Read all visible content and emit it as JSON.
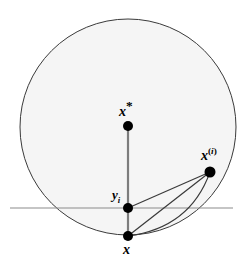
{
  "figure": {
    "background_color": "#ffffff",
    "disk": {
      "name": "feasible-disk",
      "center_x": 128,
      "center_y": 127,
      "radius": 108,
      "fill_color": "#f5f5f5",
      "stroke_color": "#3a3a3a",
      "stroke_width": 1
    },
    "hyperplane": {
      "name": "horizontal-hyperplane",
      "y": 208,
      "x_start": 10,
      "x_end": 233,
      "stroke_color": "#8c8c8c",
      "stroke_width": 1.2
    },
    "points": [
      {
        "id": "x-star",
        "label": "x*",
        "x": 128,
        "y": 126,
        "radius": 5.0,
        "color": "#000000"
      },
      {
        "id": "y-i",
        "label": "yi",
        "x": 128,
        "y": 208,
        "radius": 5.0,
        "color": "#000000"
      },
      {
        "id": "x",
        "label": "x",
        "x": 128,
        "y": 236,
        "radius": 5.0,
        "color": "#000000"
      },
      {
        "id": "x-i",
        "label": "x(i)",
        "x": 210,
        "y": 172,
        "radius": 5.5,
        "color": "#000000"
      }
    ],
    "segments": [
      {
        "id": "seg-xstar-to-x",
        "x1": 128,
        "y1": 126,
        "x2": 128,
        "y2": 236,
        "color": "#7d7d7d",
        "width": 2.2
      },
      {
        "id": "seg-yi-to-xi",
        "x1": 128,
        "y1": 208,
        "x2": 210,
        "y2": 172,
        "color": "#3a3a3a",
        "width": 1.2
      },
      {
        "id": "seg-x-to-xi",
        "x1": 128,
        "y1": 236,
        "x2": 210,
        "y2": 172,
        "color": "#3a3a3a",
        "width": 1.2
      }
    ],
    "arc": {
      "id": "arc-x-to-xi",
      "description": "curved arc from x to x(i)",
      "start_x": 128,
      "start_y": 236,
      "end_x": 210,
      "end_y": 172,
      "control_x": 190,
      "control_y": 228,
      "color": "#3a3a3a",
      "width": 1.1
    },
    "labels": {
      "x_star": {
        "base": "x",
        "mark": "*"
      },
      "y_i": {
        "base": "y",
        "sub": "i"
      },
      "x": {
        "base": "x"
      },
      "x_i": {
        "base": "x",
        "sup_open": "(",
        "sup_index": "i",
        "sup_close": ")"
      }
    }
  }
}
